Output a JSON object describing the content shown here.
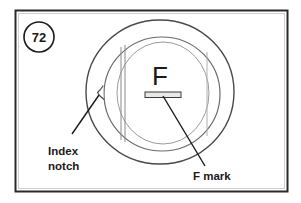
{
  "figure": {
    "step_number": "72",
    "title_letter": "F",
    "labels": {
      "index_notch_line1": "Index",
      "index_notch_line2": "notch",
      "f_mark": "F mark"
    },
    "colors": {
      "ink": "#1a1a1a",
      "line": "#3a3a3a",
      "faint_line": "#9a9a9a",
      "mark_fill": "#e8e8e8",
      "background": "#ffffff",
      "frame": "#2a2a2a"
    },
    "geometry": {
      "frame": {
        "x": 15,
        "y": 10,
        "width": 273,
        "height": 182
      },
      "step_badge": {
        "cx": 39,
        "cy": 37,
        "r": 15
      },
      "outer_ring": {
        "cx": 160,
        "cy": 92,
        "rx": 74,
        "ry": 72
      },
      "inner_ring": {
        "cx": 162,
        "cy": 94,
        "rx": 58,
        "ry": 57
      },
      "bore": {
        "cx": 163,
        "cy": 94,
        "rx": 45,
        "ry": 52
      },
      "index_notch": {
        "x": 99,
        "y": 94
      },
      "f_mark_bar": {
        "x": 145,
        "y": 92,
        "width": 36,
        "height": 5
      },
      "left_rib": {
        "x1": 121,
        "x2": 125,
        "y_top": 45,
        "y_bottom": 141
      },
      "right_rib": {
        "x": 207,
        "y_top": 50,
        "y_bottom": 138
      }
    }
  }
}
